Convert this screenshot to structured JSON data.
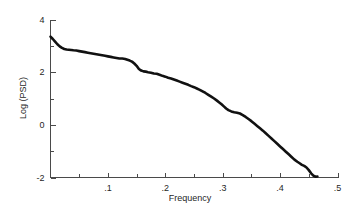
{
  "chart_data": {
    "type": "line",
    "title": "",
    "subtitle": "",
    "xlabel": "Frequency",
    "ylabel": "Log (PSD)",
    "xlim": [
      0,
      0.5
    ],
    "ylim": [
      -2,
      4
    ],
    "grid": false,
    "legend": null,
    "legend_position": "none",
    "x_major_ticks": [
      0.1,
      0.2,
      0.3,
      0.4,
      0.5
    ],
    "x_major_tick_labels": [
      ".1",
      ".2",
      ".3",
      ".4",
      ".5"
    ],
    "x_minor_ticks": [
      0.05,
      0.15,
      0.25,
      0.35,
      0.45
    ],
    "y_major_ticks": [
      4,
      2,
      0,
      -2
    ],
    "y_major_tick_labels": [
      "4",
      "2",
      "0",
      "-2"
    ],
    "y_minor_ticks": [
      3,
      1,
      -1
    ],
    "series": [
      {
        "name": "Log (PSD) spectrum",
        "color": "#111111",
        "x": [
          0.0,
          0.004,
          0.008,
          0.012,
          0.016,
          0.02,
          0.024,
          0.028,
          0.032,
          0.036,
          0.04,
          0.045,
          0.05,
          0.055,
          0.06,
          0.065,
          0.07,
          0.075,
          0.08,
          0.085,
          0.09,
          0.095,
          0.1,
          0.105,
          0.11,
          0.115,
          0.12,
          0.125,
          0.13,
          0.134,
          0.138,
          0.142,
          0.146,
          0.15,
          0.154,
          0.158,
          0.162,
          0.166,
          0.17,
          0.175,
          0.18,
          0.185,
          0.19,
          0.195,
          0.2,
          0.205,
          0.21,
          0.215,
          0.22,
          0.225,
          0.23,
          0.235,
          0.24,
          0.245,
          0.25,
          0.255,
          0.26,
          0.265,
          0.27,
          0.275,
          0.28,
          0.285,
          0.29,
          0.294,
          0.298,
          0.302,
          0.306,
          0.31,
          0.315,
          0.32,
          0.325,
          0.33,
          0.335,
          0.34,
          0.345,
          0.35,
          0.355,
          0.36,
          0.365,
          0.37,
          0.375,
          0.38,
          0.385,
          0.39,
          0.395,
          0.4,
          0.405,
          0.41,
          0.415,
          0.42,
          0.425,
          0.43,
          0.434,
          0.438,
          0.442,
          0.446,
          0.45,
          0.454,
          0.458,
          0.462,
          0.465
        ],
        "y": [
          3.35,
          3.26,
          3.16,
          3.06,
          2.98,
          2.92,
          2.88,
          2.86,
          2.85,
          2.84,
          2.83,
          2.82,
          2.8,
          2.78,
          2.76,
          2.74,
          2.72,
          2.7,
          2.68,
          2.66,
          2.64,
          2.62,
          2.6,
          2.58,
          2.56,
          2.54,
          2.52,
          2.52,
          2.5,
          2.47,
          2.44,
          2.4,
          2.33,
          2.24,
          2.12,
          2.06,
          2.03,
          2.02,
          2.0,
          1.98,
          1.95,
          1.94,
          1.9,
          1.86,
          1.83,
          1.79,
          1.76,
          1.72,
          1.68,
          1.64,
          1.6,
          1.56,
          1.52,
          1.47,
          1.43,
          1.38,
          1.33,
          1.27,
          1.21,
          1.14,
          1.07,
          1.0,
          0.92,
          0.85,
          0.78,
          0.7,
          0.62,
          0.56,
          0.51,
          0.48,
          0.46,
          0.43,
          0.37,
          0.3,
          0.22,
          0.14,
          0.05,
          -0.04,
          -0.13,
          -0.22,
          -0.32,
          -0.42,
          -0.52,
          -0.62,
          -0.72,
          -0.82,
          -0.92,
          -1.02,
          -1.12,
          -1.22,
          -1.32,
          -1.4,
          -1.46,
          -1.52,
          -1.56,
          -1.62,
          -1.72,
          -1.84,
          -1.93,
          -1.97,
          -1.96
        ]
      }
    ]
  },
  "axes": {
    "ylabel": "Log (PSD)",
    "xlabel": "Frequency",
    "y_labels": [
      "4",
      "2",
      "0",
      "-2"
    ],
    "x_labels": [
      ".1",
      ".2",
      ".3",
      ".4",
      ".5"
    ]
  }
}
